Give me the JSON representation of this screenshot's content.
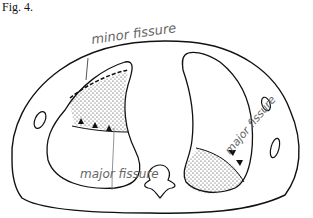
{
  "figure": {
    "label": "Fig. 4.",
    "annotations": {
      "minor_fissure": "minor fissure",
      "major_right": "major fissure",
      "major_left": "major fissure"
    },
    "colors": {
      "line": "#111111",
      "annotation": "#666666",
      "background": "#ffffff"
    }
  }
}
